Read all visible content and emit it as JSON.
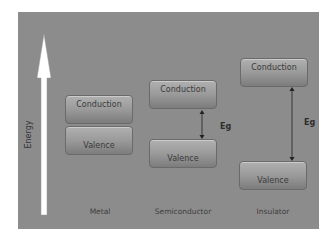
{
  "diagram": {
    "axis_label": "Energy",
    "columns": [
      {
        "name": "Metal",
        "conduction": "Conduction",
        "valence": "Valence"
      },
      {
        "name": "Semiconductor",
        "conduction": "Conduction",
        "valence": "Valence",
        "gap_label": "Eg"
      },
      {
        "name": "Insulator",
        "conduction": "Conduction",
        "valence": "Valence",
        "gap_label": "Eg"
      }
    ]
  },
  "colors": {
    "background": "#8c8c8c",
    "band_top": "#b0b0b0",
    "band_bottom": "#7c7c7c",
    "arrow": "#ffffff"
  }
}
